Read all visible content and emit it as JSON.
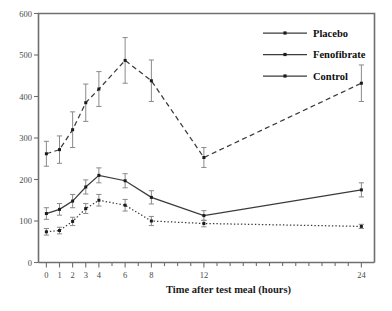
{
  "chart_data": {
    "type": "line",
    "title": "",
    "xlabel": "Time after test meal (hours)",
    "ylabel": "",
    "xlim": [
      -0.6,
      25.0
    ],
    "ylim": [
      0,
      600
    ],
    "grid": false,
    "legend_position": "top-right",
    "x_tick_labels": [
      "0",
      "1",
      "2",
      "3",
      "4",
      "6",
      "8",
      "12",
      "24"
    ],
    "x_tick_values": [
      0,
      1,
      2,
      3,
      4,
      6,
      8,
      12,
      24
    ],
    "x_minor_ticks": [
      5,
      7,
      9,
      10,
      11,
      13,
      14,
      15,
      16,
      17,
      18,
      19,
      20,
      21,
      22,
      23
    ],
    "y_tick_labels": [
      "0",
      "100",
      "200",
      "300",
      "400",
      "500",
      "600"
    ],
    "y_tick_values": [
      0,
      100,
      200,
      300,
      400,
      500,
      600
    ],
    "x": [
      0,
      1,
      2,
      3,
      4,
      6,
      8,
      12,
      24
    ],
    "series": [
      {
        "name": "Placebo",
        "style": "dashed",
        "values": [
          262,
          272,
          320,
          385,
          418,
          487,
          438,
          253,
          432
        ],
        "err_low": [
          30,
          33,
          43,
          45,
          42,
          55,
          50,
          24,
          44
        ],
        "err_high": [
          30,
          33,
          43,
          45,
          42,
          55,
          50,
          24,
          44
        ]
      },
      {
        "name": "Fenofibrate",
        "style": "solid",
        "values": [
          118,
          128,
          148,
          182,
          210,
          197,
          157,
          113,
          175
        ],
        "err_low": [
          14,
          14,
          16,
          17,
          18,
          17,
          16,
          12,
          17
        ],
        "err_high": [
          14,
          14,
          16,
          17,
          18,
          17,
          16,
          12,
          17
        ]
      },
      {
        "name": "Control",
        "style": "dotted",
        "values": [
          74,
          77,
          99,
          130,
          150,
          138,
          100,
          94,
          87
        ],
        "err_low": [
          8,
          8,
          10,
          12,
          14,
          14,
          11,
          8,
          5
        ],
        "err_high": [
          8,
          8,
          10,
          12,
          14,
          14,
          11,
          8,
          5
        ]
      }
    ],
    "colors": {
      "line": "#3a3a3a",
      "marker": "#1c1c1c",
      "axis": "#6f6f6f",
      "errorbar": "#8a8a8a",
      "text": "#1a1a1a",
      "background": "#ffffff"
    }
  },
  "legend": {
    "entries": [
      {
        "label": "Placebo"
      },
      {
        "label": "Fenofibrate"
      },
      {
        "label": "Control"
      }
    ]
  },
  "axis": {
    "x_title": "Time after test meal (hours)"
  }
}
